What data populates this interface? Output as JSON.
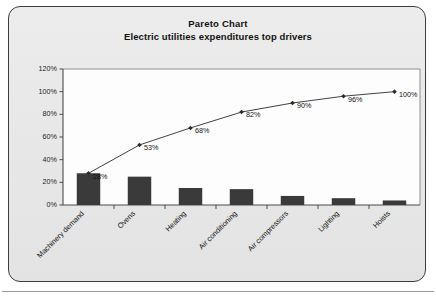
{
  "card": {
    "background_color": "#e9e9e9",
    "border_color": "#3d3d3d"
  },
  "header": {
    "title": "Pareto Chart",
    "subtitle": "Electric utilities expenditures top drivers"
  },
  "chart_data": {
    "type": "bar",
    "title": "Pareto Chart",
    "subtitle": "Electric utilities expenditures top drivers",
    "xlabel": "",
    "ylabel": "",
    "ylim": [
      0,
      120
    ],
    "yticks": [
      0,
      20,
      40,
      60,
      80,
      100,
      120
    ],
    "ytick_labels": [
      "0%",
      "20%",
      "40%",
      "60%",
      "80%",
      "100%",
      "120%"
    ],
    "grid": false,
    "legend": "none",
    "categories": [
      "Machinery demand",
      "Ovens",
      "Heating",
      "Air conditioning",
      "Air compressors",
      "Lighting",
      "Hoists"
    ],
    "series": [
      {
        "name": "Share of expenditures",
        "type": "bar",
        "values": [
          28,
          25,
          15,
          14,
          8,
          6,
          4
        ],
        "color": "#3a3a3a"
      },
      {
        "name": "Cumulative percentage",
        "type": "line",
        "values": [
          28,
          53,
          68,
          82,
          90,
          96,
          100
        ],
        "color": "#2c2c2c",
        "marker": "diamond",
        "data_labels": [
          "28%",
          "53%",
          "68%",
          "82%",
          "90%",
          "96%",
          "100%"
        ]
      }
    ]
  }
}
